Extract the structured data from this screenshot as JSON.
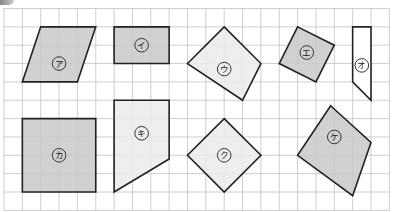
{
  "grid": {
    "origin_x": 4,
    "origin_y": 8.5,
    "cell": 18.35,
    "cols": 21,
    "rows": 11,
    "line_color": "#c8c8c8",
    "background": "#ffffff"
  },
  "colors": {
    "fill_dark": "#c9c9c9",
    "fill_light": "#ebebeb",
    "outline": "#222222"
  },
  "shapes": [
    {
      "id": "a",
      "label": "ア",
      "fill": "dark",
      "points": [
        [
          2,
          1
        ],
        [
          5,
          1
        ],
        [
          4,
          4
        ],
        [
          1,
          4
        ]
      ],
      "label_at": [
        3,
        3
      ]
    },
    {
      "id": "i",
      "label": "イ",
      "fill": "dark",
      "points": [
        [
          6,
          1
        ],
        [
          9,
          1
        ],
        [
          9,
          3
        ],
        [
          6,
          3
        ]
      ],
      "label_at": [
        7.5,
        2
      ]
    },
    {
      "id": "u",
      "label": "ウ",
      "fill": "light",
      "points": [
        [
          12,
          1
        ],
        [
          14,
          3
        ],
        [
          13,
          5
        ],
        [
          10,
          3
        ]
      ],
      "label_at": [
        12,
        3.3
      ]
    },
    {
      "id": "e",
      "label": "エ",
      "fill": "dark",
      "points": [
        [
          16,
          1
        ],
        [
          18,
          2
        ],
        [
          17,
          4
        ],
        [
          15,
          3
        ]
      ],
      "label_at": [
        16.5,
        2.4
      ]
    },
    {
      "id": "o",
      "label": "オ",
      "fill": "white",
      "points": [
        [
          19,
          1
        ],
        [
          20,
          1
        ],
        [
          20,
          5
        ],
        [
          19,
          4
        ]
      ],
      "label_at": [
        19.5,
        3.1
      ]
    },
    {
      "id": "ka",
      "label": "カ",
      "fill": "dark",
      "points": [
        [
          1,
          6
        ],
        [
          5,
          6
        ],
        [
          5,
          10
        ],
        [
          1,
          10
        ]
      ],
      "label_at": [
        3,
        8
      ]
    },
    {
      "id": "ki",
      "label": "キ",
      "fill": "light",
      "points": [
        [
          6,
          5
        ],
        [
          9,
          5
        ],
        [
          9,
          8.2
        ],
        [
          6,
          10
        ]
      ],
      "label_at": [
        7.5,
        6.8
      ]
    },
    {
      "id": "ku",
      "label": "ク",
      "fill": "light",
      "points": [
        [
          12,
          6
        ],
        [
          14,
          8
        ],
        [
          12,
          10
        ],
        [
          10,
          8
        ]
      ],
      "label_at": [
        12,
        8
      ]
    },
    {
      "id": "ke",
      "label": "ケ",
      "fill": "dark",
      "points": [
        [
          17.8,
          5.3
        ],
        [
          20,
          7.3
        ],
        [
          19,
          10.2
        ],
        [
          16,
          8
        ]
      ],
      "label_at": [
        18,
        7
      ]
    }
  ]
}
